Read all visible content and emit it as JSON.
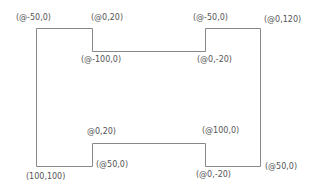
{
  "diagram": {
    "type": "polyline-shape",
    "stroke_color": "#888888",
    "label_color": "#555555",
    "labels": [
      {
        "id": "start",
        "text": "(@-50,0)"
      },
      {
        "id": "top-notch-left",
        "text": "(@0,20)"
      },
      {
        "id": "top-notch-bottom",
        "text": "(@-100,0)"
      },
      {
        "id": "top-notch-right-bottom",
        "text": "(@0,-20)"
      },
      {
        "id": "top-notch-right",
        "text": "(@-50,0)"
      },
      {
        "id": "top-right",
        "text": "(@0,120)"
      },
      {
        "id": "bottom-notch-left",
        "text": "@0,20)"
      },
      {
        "id": "bottom-left-inner",
        "text": "(@50,0)"
      },
      {
        "id": "bottom-left",
        "text": "(100,100)"
      },
      {
        "id": "bottom-notch-top",
        "text": "(@100,0)"
      },
      {
        "id": "bottom-notch-right-bottom",
        "text": "(@0,-20)"
      },
      {
        "id": "bottom-right",
        "text": "(@50,0)"
      }
    ]
  }
}
